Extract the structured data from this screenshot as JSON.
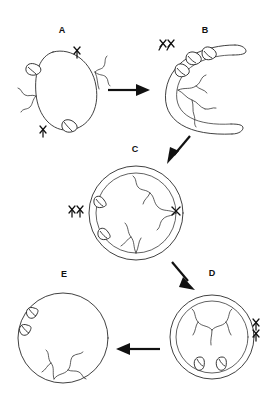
{
  "figure": {
    "background_color": "#ffffff",
    "stroke_color": "#2b2b2b",
    "label_color": "#111111",
    "width": 278,
    "height": 411,
    "panel_count": 5,
    "arrow_count": 4
  },
  "panels": [
    {
      "id": "A",
      "label": "A",
      "label_x": 62,
      "label_y": 33,
      "shape": "ellipse",
      "membrane_layers": 1,
      "center_x": 67,
      "center_y": 89,
      "radius_x": 30,
      "radius_y": 40,
      "rotation_deg": -20,
      "bud_count": 2,
      "filament_count": 2,
      "xmark_count": 2,
      "description": "Single oval membrane with two external buds and two branched filaments"
    },
    {
      "id": "B",
      "label": "B",
      "label_x": 205,
      "label_y": 33,
      "shape": "crescent",
      "membrane_layers": 2,
      "center_x": 205,
      "center_y": 88,
      "radius_x": 40,
      "radius_y": 47,
      "rotation_deg": 0,
      "bud_count": 3,
      "filament_count": 2,
      "xmark_count": 2,
      "description": "Open C-shaped double membrane cup opening to the right"
    },
    {
      "id": "C",
      "label": "C",
      "label_x": 135,
      "label_y": 152,
      "shape": "circle-double",
      "membrane_layers": 2,
      "center_x": 136,
      "center_y": 213,
      "radius_x": 47,
      "radius_y": 47,
      "rotation_deg": 0,
      "bud_count": 2,
      "filament_count": 3,
      "xmark_count": 2,
      "description": "Nearly sealed double-membrane sphere with closure point at right"
    },
    {
      "id": "D",
      "label": "D",
      "label_x": 212,
      "label_y": 276,
      "shape": "circle-double",
      "membrane_layers": 2,
      "center_x": 212,
      "center_y": 337,
      "radius_x": 42,
      "radius_y": 42,
      "rotation_deg": 0,
      "bud_count": 2,
      "filament_count": 3,
      "xmark_count": 2,
      "description": "Fully sealed double-membrane sphere, buds rotated to bottom interior"
    },
    {
      "id": "E",
      "label": "E",
      "label_x": 64,
      "label_y": 277,
      "shape": "circle-single",
      "membrane_layers": 1,
      "center_x": 63,
      "center_y": 338,
      "radius_x": 45,
      "radius_y": 45,
      "rotation_deg": 0,
      "bud_count": 2,
      "filament_count": 3,
      "xmark_count": 0,
      "description": "Single membrane sphere with internal buds and filaments, inner membrane degraded"
    }
  ],
  "arrows": [
    {
      "id": "arrow-a-to-b",
      "from": "A",
      "to": "B",
      "direction": "right",
      "x1": 106,
      "y1": 90,
      "x2": 146,
      "y2": 90
    },
    {
      "id": "arrow-b-to-c",
      "from": "B",
      "to": "C",
      "direction": "down-left",
      "x1": 188,
      "y1": 136,
      "x2": 167,
      "y2": 162
    },
    {
      "id": "arrow-c-to-d",
      "from": "C",
      "to": "D",
      "direction": "down-right",
      "x1": 171,
      "y1": 261,
      "x2": 192,
      "y2": 288
    },
    {
      "id": "arrow-d-to-e",
      "from": "D",
      "to": "E",
      "direction": "left",
      "x1": 158,
      "y1": 349,
      "x2": 118,
      "y2": 349
    }
  ]
}
